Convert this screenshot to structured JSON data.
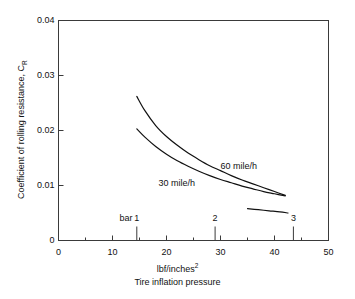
{
  "chart_data": {
    "type": "line",
    "title": "",
    "xlabel": "Tire inflation pressure",
    "xlabel_unit": "lbf/inches",
    "xlabel_unit_sup": "2",
    "ylabel_text": "Coefficient of rolling resistance, C",
    "ylabel_sub": "R",
    "xlim": [
      0,
      50
    ],
    "ylim": [
      0,
      0.04
    ],
    "x_ticks": [
      0,
      10,
      20,
      30,
      40,
      50
    ],
    "x_tick_labels": [
      "0",
      "10",
      "20",
      "30",
      "40",
      "50"
    ],
    "x_minor_ticks": [
      5,
      15,
      25,
      35,
      45
    ],
    "y_ticks": [
      0,
      0.01,
      0.02,
      0.03,
      0.04
    ],
    "y_tick_labels": [
      "0",
      "0.01",
      "0.02",
      "0.03",
      "0.04"
    ],
    "grid": false,
    "legend": "inline-annotations",
    "secondary_axis": {
      "name": "bar",
      "label": "bar",
      "label_psi_position": 12.5,
      "ticks_bar": [
        1,
        2,
        3
      ],
      "tick_labels": [
        "1",
        "2",
        "3"
      ],
      "ticks_psi": [
        14.5,
        29.0,
        43.5
      ]
    },
    "series": [
      {
        "name": "60 mile/h",
        "label": "60 mile/h",
        "label_x_psi": 30.0,
        "label_y": 0.0134,
        "x": [
          14.5,
          16.0,
          18.0,
          20.0,
          22.0,
          24.0,
          26.0,
          28.0,
          30.0,
          32.0,
          34.0,
          36.0,
          38.0,
          40.0,
          42.0
        ],
        "y": [
          0.0262,
          0.0236,
          0.0209,
          0.0189,
          0.0173,
          0.0159,
          0.0147,
          0.0136,
          0.0127,
          0.0118,
          0.011,
          0.0103,
          0.0096,
          0.0089,
          0.0082
        ]
      },
      {
        "name": "30 mile/h",
        "label": "30 mile/h",
        "label_x_psi": 18.5,
        "label_y": 0.0103,
        "x": [
          14.5,
          16.0,
          18.0,
          20.0,
          22.0,
          24.0,
          26.0,
          28.0,
          30.0,
          32.0,
          34.0,
          36.0,
          38.0,
          40.0,
          42.0
        ],
        "y": [
          0.0203,
          0.0188,
          0.0171,
          0.0157,
          0.0145,
          0.0135,
          0.0126,
          0.0118,
          0.0111,
          0.0105,
          0.0099,
          0.0094,
          0.0089,
          0.0085,
          0.0081
        ]
      },
      {
        "name": "lower-segment",
        "label": "",
        "x": [
          35.0,
          37.0,
          39.0,
          41.0,
          42.5
        ],
        "y": [
          0.0058,
          0.0056,
          0.0054,
          0.0052,
          0.005
        ]
      }
    ]
  }
}
